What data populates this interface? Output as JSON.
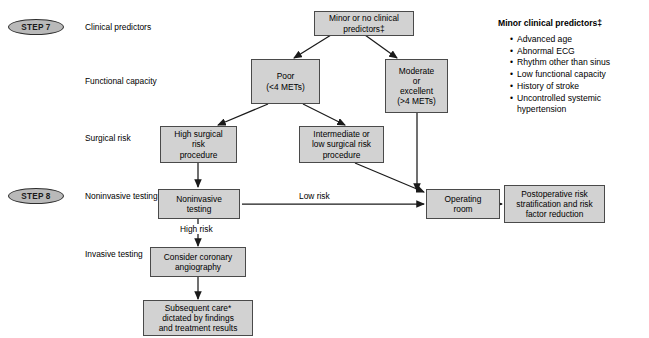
{
  "diagram": {
    "box_fill": "#d2d2d2",
    "box_border": "#4a4a4a",
    "line_color": "#1a1a1a"
  },
  "steps": [
    {
      "id": "step7",
      "label": "STEP 7"
    },
    {
      "id": "step8",
      "label": "STEP 8"
    }
  ],
  "row_labels": [
    {
      "id": "clinical-predictors",
      "label": "Clinical predictors"
    },
    {
      "id": "functional-capacity",
      "label": "Functional capacity"
    },
    {
      "id": "surgical-risk",
      "label": "Surgical risk"
    },
    {
      "id": "noninvasive-testing",
      "label": "Noninvasive testing"
    },
    {
      "id": "invasive-testing",
      "label": "Invasive testing"
    }
  ],
  "nodes": [
    {
      "id": "minor-predictors",
      "text": "Minor or no clinical\npredictors‡"
    },
    {
      "id": "poor-mets",
      "text": "Poor\n(<4 METs)"
    },
    {
      "id": "moderate-excellent-mets",
      "text": "Moderate\nor\nexcellent\n(>4 METs)"
    },
    {
      "id": "high-surgical-risk",
      "text": "High surgical\nrisk\nprocedure"
    },
    {
      "id": "intermediate-low-surgical-risk",
      "text": "Intermediate or\nlow surgical risk\nprocedure"
    },
    {
      "id": "noninvasive-testing-box",
      "text": "Noninvasive\ntesting"
    },
    {
      "id": "operating-room",
      "text": "Operating\nroom"
    },
    {
      "id": "postoperative-risk",
      "text": "Postoperative risk\nstratification and risk\nfactor reduction"
    },
    {
      "id": "coronary-angiography",
      "text": "Consider coronary\nangiography"
    },
    {
      "id": "subsequent-care",
      "text": "Subsequent care*\ndictated by findings\nand treatment results"
    }
  ],
  "edge_labels": [
    {
      "id": "low-risk",
      "label": "Low risk"
    },
    {
      "id": "high-risk",
      "label": "High risk"
    }
  ],
  "legend": {
    "title": "Minor clinical predictors‡",
    "items": [
      "Advanced age",
      "Abnormal ECG",
      "Rhythm other\nthan sinus",
      "Low functional\ncapacity",
      "History of stroke",
      "Uncontrolled systemic\nhypertension"
    ]
  }
}
